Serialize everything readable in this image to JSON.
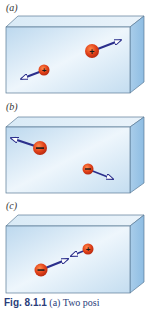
{
  "figure": {
    "panels": [
      {
        "label": "(a)",
        "description": "Two positive charges moving apart",
        "charges": [
          {
            "sign": "+",
            "x": 44,
            "y": 70
          },
          {
            "sign": "+",
            "x": 92,
            "y": 51
          }
        ],
        "arrows": [
          "from left charge pointing down-left",
          "from right charge pointing up-right"
        ]
      },
      {
        "label": "(b)",
        "description": "Two negative charges moving apart",
        "charges": [
          {
            "sign": "−",
            "x": 40,
            "y": 148
          },
          {
            "sign": "−",
            "x": 88,
            "y": 169
          }
        ],
        "arrows": [
          "from left charge pointing up-left",
          "from right charge pointing down-right"
        ]
      },
      {
        "label": "(c)",
        "description": "Negative and positive charges attracting",
        "charges": [
          {
            "sign": "−",
            "x": 41,
            "y": 270
          },
          {
            "sign": "+",
            "x": 88,
            "y": 249
          }
        ],
        "arrows": [
          "between charges, pointing toward each other"
        ]
      }
    ],
    "caption": {
      "label": "Fig. 8.1.1",
      "text": "(a) Two posi"
    },
    "colors": {
      "box_front": "#cfe3f2",
      "box_top": "#e6f1f8",
      "box_side": "#9fc6e6",
      "charge": "#e0401c",
      "arrow": "#2b2f8c",
      "caption": "#2a3d7a"
    }
  }
}
